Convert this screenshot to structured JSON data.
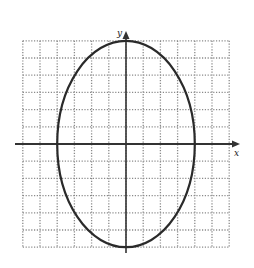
{
  "figure": {
    "x_axis_label": "x",
    "y_axis_label": "y",
    "grid": {
      "x_min": -6,
      "x_max": 6,
      "y_min": -6,
      "y_max": 6,
      "step": 1,
      "line_style": "dotted",
      "line_color": "#8a8a8a"
    },
    "ellipse": {
      "center": [
        0,
        0
      ],
      "semi_axis_x": 4,
      "semi_axis_y": 6,
      "stroke_color": "#2a2a2a"
    },
    "axis_color": "#333333"
  }
}
